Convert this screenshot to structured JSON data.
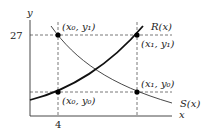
{
  "diagram": {
    "axes": {
      "x_label": "x",
      "y_label": "y"
    },
    "ticks": {
      "x_tick": "4",
      "y_tick": "27"
    },
    "curves": [
      {
        "name": "R(x)",
        "label": "R(x)",
        "style": "thick increasing"
      },
      {
        "name": "S(x)",
        "label": "S(x)",
        "style": "thin decreasing"
      }
    ],
    "points": [
      {
        "label": "(x₀, y₁)"
      },
      {
        "label": "(x₁, y₁)"
      },
      {
        "label": "(x₀, y₀)"
      },
      {
        "label": "(x₁, y₀)"
      }
    ],
    "colors": {
      "ink": "#111111",
      "dash": "#555555"
    }
  }
}
